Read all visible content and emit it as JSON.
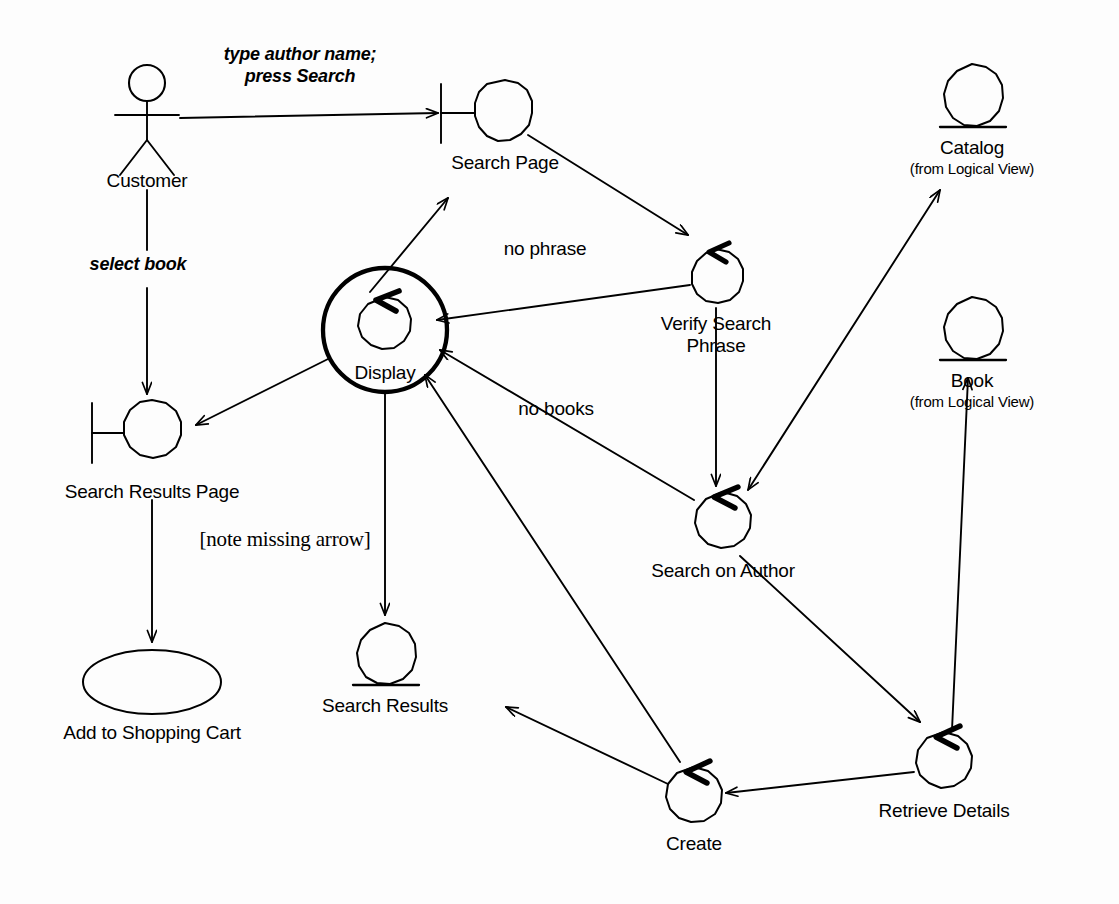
{
  "diagram": {
    "type": "uml-collaboration-diagram",
    "title": "",
    "background_color": "#fdfdfd",
    "line_color": "#000000",
    "nodes": [
      {
        "id": "customer",
        "kind": "actor",
        "label": "Customer",
        "sublabel": "",
        "x": 147,
        "y": 110
      },
      {
        "id": "search_page",
        "kind": "boundary",
        "label": "Search Page",
        "sublabel": "",
        "x": 505,
        "y": 113
      },
      {
        "id": "catalog",
        "kind": "entity",
        "label": "Catalog",
        "sublabel": "(from Logical View)",
        "x": 972,
        "y": 102
      },
      {
        "id": "book",
        "kind": "entity",
        "label": "Book",
        "sublabel": "(from Logical View)",
        "x": 972,
        "y": 335
      },
      {
        "id": "verify_search_phrase",
        "kind": "control",
        "label": "Verify Search\nPhrase",
        "sublabel": "",
        "x": 716,
        "y": 280
      },
      {
        "id": "display",
        "kind": "control",
        "label": "Display",
        "sublabel": "",
        "x": 385,
        "y": 330,
        "selected": true
      },
      {
        "id": "search_results_page",
        "kind": "boundary",
        "label": "Search Results Page",
        "sublabel": "",
        "x": 152,
        "y": 430
      },
      {
        "id": "search_on_author",
        "kind": "control",
        "label": "Search on Author",
        "sublabel": "",
        "x": 723,
        "y": 525
      },
      {
        "id": "search_results",
        "kind": "entity",
        "label": "Search Results",
        "sublabel": "",
        "x": 385,
        "y": 658
      },
      {
        "id": "add_to_shopping_cart",
        "kind": "usecase",
        "label": "Add to Shopping Cart",
        "sublabel": "",
        "x": 152,
        "y": 682
      },
      {
        "id": "create",
        "kind": "control",
        "label": "Create",
        "sublabel": "",
        "x": 694,
        "y": 800
      },
      {
        "id": "retrieve_details",
        "kind": "control",
        "label": "Retrieve Details",
        "sublabel": "",
        "x": 944,
        "y": 765
      }
    ],
    "messages": [
      {
        "id": "m1",
        "from": "customer",
        "to": "search_page",
        "label": "type author name;\npress Search",
        "style": "italic"
      },
      {
        "id": "m2",
        "from": "customer",
        "to": "search_results_page",
        "label": "select book",
        "style": "italic"
      },
      {
        "id": "m3",
        "from": "search_page",
        "to": "verify_search_phrase",
        "label": "",
        "style": "plain"
      },
      {
        "id": "m4",
        "from": "verify_search_phrase",
        "to": "display",
        "label": "no phrase",
        "style": "plain"
      },
      {
        "id": "m5",
        "from": "verify_search_phrase",
        "to": "search_on_author",
        "label": "",
        "style": "plain"
      },
      {
        "id": "m6",
        "from": "search_on_author",
        "to": "catalog",
        "label": "",
        "style": "bidirectional"
      },
      {
        "id": "m7",
        "from": "search_on_author",
        "to": "display",
        "label": "no books",
        "style": "plain"
      },
      {
        "id": "m8",
        "from": "search_on_author",
        "to": "retrieve_details",
        "label": "",
        "style": "plain"
      },
      {
        "id": "m9",
        "from": "retrieve_details",
        "to": "book",
        "label": "",
        "style": "plain"
      },
      {
        "id": "m10",
        "from": "retrieve_details",
        "to": "create",
        "label": "",
        "style": "plain"
      },
      {
        "id": "m11",
        "from": "create",
        "to": "search_results",
        "label": "",
        "style": "plain"
      },
      {
        "id": "m12",
        "from": "create",
        "to": "display",
        "label": "",
        "style": "plain"
      },
      {
        "id": "m13",
        "from": "display",
        "to": "search_page",
        "label": "",
        "style": "plain"
      },
      {
        "id": "m14",
        "from": "display",
        "to": "search_results_page",
        "label": "",
        "style": "plain"
      },
      {
        "id": "m15",
        "from": "display",
        "to": "search_results",
        "label": "",
        "style": "plain"
      },
      {
        "id": "m16",
        "from": "search_results_page",
        "to": "add_to_shopping_cart",
        "label": "",
        "style": "plain"
      }
    ],
    "labels": {
      "customer": "Customer",
      "search_page": "Search Page",
      "catalog_name": "Catalog",
      "catalog_from": "(from Logical View)",
      "book_name": "Book",
      "book_from": "(from Logical View)",
      "verify_search_phrase_l1": "Verify Search",
      "verify_search_phrase_l2": "Phrase",
      "display": "Display",
      "search_results_page": "Search Results Page",
      "search_on_author": "Search on Author",
      "search_results": "Search Results",
      "add_to_shopping_cart": "Add to Shopping Cart",
      "create": "Create",
      "retrieve_details": "Retrieve Details",
      "msg_type_author_l1": "type author name;",
      "msg_type_author_l2": "press Search",
      "msg_select_book": "select book",
      "msg_no_phrase": "no phrase",
      "msg_no_books": "no books",
      "annotation_note": "[note missing arrow]"
    }
  }
}
